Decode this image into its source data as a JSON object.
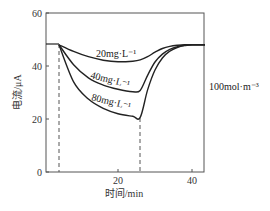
{
  "chart_data": {
    "type": "line",
    "title": "",
    "xlabel": "时间/min",
    "ylabel": "电流/μA",
    "xlim": [
      0,
      43.5
    ],
    "ylim": [
      0,
      60
    ],
    "x_ticks": [
      20,
      40
    ],
    "y_ticks": [
      0,
      20,
      40,
      60
    ],
    "grid": false,
    "annotation": "100mol·m⁻³",
    "reference_lines": [
      {
        "type": "vertical-dashed",
        "x": 4
      },
      {
        "type": "vertical-dashed",
        "x": 26
      }
    ],
    "series": [
      {
        "name": "20mg·L⁻¹",
        "x": [
          0,
          4,
          8,
          12,
          16,
          20,
          24,
          26,
          28,
          30,
          32,
          34,
          36,
          38,
          40,
          43.5
        ],
        "values": [
          48,
          48,
          45.5,
          43.5,
          42.2,
          41.6,
          41.8,
          42.3,
          43.5,
          45.2,
          46.6,
          47.4,
          47.8,
          48,
          48,
          48
        ]
      },
      {
        "name": "40mg·L⁻¹",
        "x": [
          0,
          4,
          8,
          12,
          16,
          20,
          24,
          26,
          28,
          30,
          32,
          34,
          36,
          38,
          40,
          43.5
        ],
        "values": [
          48,
          48,
          40.5,
          35.5,
          32.8,
          31.2,
          30.3,
          30.8,
          36.5,
          41.5,
          44.5,
          46.3,
          47.3,
          47.8,
          48,
          48
        ]
      },
      {
        "name": "80mg·L⁻¹",
        "x": [
          0,
          4,
          8,
          12,
          16,
          20,
          24,
          26,
          28,
          30,
          32,
          34,
          36,
          38,
          40,
          43.5
        ],
        "values": [
          48,
          48,
          34,
          27.5,
          24,
          22,
          21,
          20.6,
          31,
          38.5,
          43,
          45.6,
          47,
          47.7,
          48,
          48
        ]
      }
    ]
  },
  "labels": {
    "y_ticks": [
      "0",
      "20",
      "40",
      "60"
    ],
    "x_ticks": [
      "20",
      "40"
    ],
    "xlabel": "时间/min",
    "ylabel": "电流/μA",
    "annotation": "100mol·m⁻³",
    "series": [
      "20mg·L⁻¹",
      "40mg·L⁻¹",
      "80mg·L⁻¹"
    ]
  },
  "colors": {
    "axis": "#555555",
    "curve": "#222222",
    "dash": "#555555"
  }
}
